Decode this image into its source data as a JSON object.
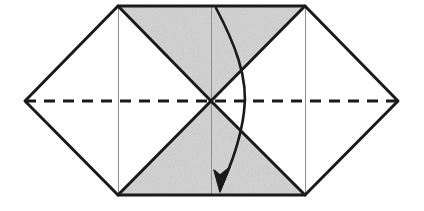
{
  "figure": {
    "type": "origami-fold-diagram",
    "canvas": {
      "width": 424,
      "height": 211
    },
    "background_color": "#ffffff",
    "stroke_color": "#1a1a1a",
    "shade_color": "#d2d2d2",
    "thin_line_color": "#8c8c8c",
    "heavy_stroke_width": 3,
    "thin_stroke_width": 1,
    "dash_stroke_width": 3,
    "dash_pattern": "11 8",
    "points": {
      "left_vertex": {
        "x": 25,
        "y": 101
      },
      "right_vertex": {
        "x": 398,
        "y": 101
      },
      "top_left": {
        "x": 118,
        "y": 6
      },
      "top_right": {
        "x": 305,
        "y": 6
      },
      "bottom_left": {
        "x": 118,
        "y": 195
      },
      "bottom_right": {
        "x": 305,
        "y": 195
      },
      "center": {
        "x": 211,
        "y": 101
      }
    },
    "outline_path": "M 25,101 L 118,6 L 305,6 L 398,101 L 305,195 L 118,195 Z",
    "shaded_regions": [
      {
        "name": "top-shaded-triangle",
        "path": "M 118,6 L 305,6 L 211,101 Z"
      },
      {
        "name": "bottom-shaded-triangle",
        "path": "M 211,101 L 305,195 L 118,195 Z"
      }
    ],
    "heavy_lines": [
      {
        "name": "edge-left-upper",
        "x1": 25,
        "y1": 101,
        "x2": 118,
        "y2": 6
      },
      {
        "name": "edge-top",
        "x1": 118,
        "y1": 6,
        "x2": 305,
        "y2": 6
      },
      {
        "name": "edge-right-upper",
        "x1": 305,
        "y1": 6,
        "x2": 398,
        "y2": 101
      },
      {
        "name": "edge-right-lower",
        "x1": 398,
        "y1": 101,
        "x2": 305,
        "y2": 195
      },
      {
        "name": "edge-bottom",
        "x1": 305,
        "y1": 195,
        "x2": 118,
        "y2": 195
      },
      {
        "name": "edge-left-lower",
        "x1": 118,
        "y1": 195,
        "x2": 25,
        "y2": 101
      },
      {
        "name": "diagonal-topleft-to-center",
        "x1": 118,
        "y1": 6,
        "x2": 211,
        "y2": 101
      },
      {
        "name": "diagonal-topright-to-center",
        "x1": 305,
        "y1": 6,
        "x2": 211,
        "y2": 101
      },
      {
        "name": "diagonal-center-to-bottomleft",
        "x1": 211,
        "y1": 101,
        "x2": 118,
        "y2": 195
      },
      {
        "name": "diagonal-center-to-bottomright",
        "x1": 211,
        "y1": 101,
        "x2": 305,
        "y2": 195
      }
    ],
    "thin_lines": [
      {
        "name": "vertical-crease-left",
        "x1": 118,
        "y1": 6,
        "x2": 118,
        "y2": 195
      },
      {
        "name": "vertical-crease-center",
        "x1": 211,
        "y1": 6,
        "x2": 211,
        "y2": 195
      },
      {
        "name": "vertical-crease-right",
        "x1": 305,
        "y1": 6,
        "x2": 305,
        "y2": 195
      }
    ],
    "dashed_lines": [
      {
        "name": "horizontal-fold-axis",
        "x1": 25,
        "y1": 101,
        "x2": 398,
        "y2": 101,
        "style": "dashed"
      }
    ],
    "fold_arrow": {
      "name": "fold-arrow",
      "description": "Curved arrow sweeping from top crease down to bottom, indicating the flap folds downward",
      "curve_path": "M 216,8 C 234,42 249,78 244,112 C 240,144 229,170 220,189",
      "arrowhead_path": "M 220,192 L 214,170 L 220,175 L 230,167 Z",
      "tip": {
        "x": 219,
        "y": 191
      }
    }
  }
}
